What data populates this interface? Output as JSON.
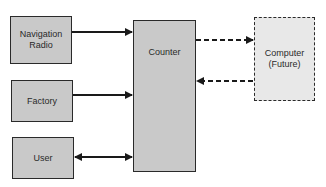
{
  "diagram": {
    "nodes": [
      {
        "id": "nav_radio",
        "label": "Navigation\nRadio",
        "style": "solid"
      },
      {
        "id": "factory",
        "label": "Factory",
        "style": "solid"
      },
      {
        "id": "user",
        "label": "User",
        "style": "solid"
      },
      {
        "id": "counter",
        "label": "Counter",
        "style": "solid"
      },
      {
        "id": "computer",
        "label": "Computer\n(Future)",
        "style": "dashed"
      }
    ],
    "edges": [
      {
        "from": "nav_radio",
        "to": "counter",
        "style": "solid",
        "direction": "forward"
      },
      {
        "from": "factory",
        "to": "counter",
        "style": "solid",
        "direction": "forward"
      },
      {
        "from": "user",
        "to": "counter",
        "style": "solid",
        "direction": "bidirectional"
      },
      {
        "from": "counter",
        "to": "computer",
        "style": "dashed",
        "direction": "forward"
      },
      {
        "from": "computer",
        "to": "counter",
        "style": "dashed",
        "direction": "forward"
      }
    ],
    "colors": {
      "box_fill": "#c9c9c9",
      "future_box_fill": "#e8e8e8",
      "stroke": "#2a2a2a"
    }
  }
}
